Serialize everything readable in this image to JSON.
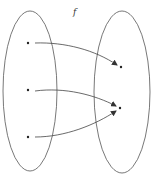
{
  "diagram": {
    "type": "function-mapping",
    "function_label": "f",
    "colors": {
      "stroke": "#555555",
      "dot": "#222222",
      "background": "#ffffff"
    },
    "domain_set": {
      "cx": 30,
      "cy": 91,
      "rx": 27,
      "ry": 80,
      "points": [
        {
          "id": "d1",
          "x": 28,
          "y": 43
        },
        {
          "id": "d2",
          "x": 28,
          "y": 90
        },
        {
          "id": "d3",
          "x": 28,
          "y": 137
        }
      ]
    },
    "codomain_set": {
      "cx": 122,
      "cy": 92,
      "rx": 28,
      "ry": 81,
      "points": [
        {
          "id": "c1",
          "x": 121,
          "y": 67
        },
        {
          "id": "c2",
          "x": 120,
          "y": 108
        }
      ]
    },
    "mappings": [
      {
        "from": "d1",
        "to": "c1"
      },
      {
        "from": "d2",
        "to": "c2"
      },
      {
        "from": "d3",
        "to": "c2"
      }
    ]
  }
}
